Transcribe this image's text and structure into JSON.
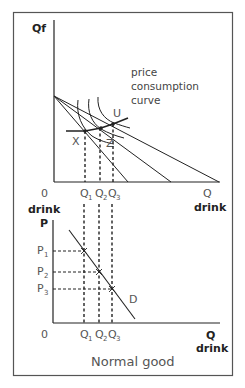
{
  "figure": {
    "caption": "Normal good",
    "top_graph": {
      "y_axis_label": "Qf",
      "x_axis_label": "Q",
      "x_axis_sublabel": "drink",
      "origin_label": "0",
      "origin_sublabel": "drink",
      "curve_annotation_lines": [
        "price",
        "consumption",
        "curve"
      ],
      "points": [
        "X",
        "Z",
        "U"
      ],
      "q_ticks": [
        {
          "main": "Q",
          "sub": "1"
        },
        {
          "main": "Q",
          "sub": "2"
        },
        {
          "main": "Q",
          "sub": "3"
        }
      ]
    },
    "bottom_graph": {
      "y_axis_label": "P",
      "x_axis_label": "Q",
      "x_axis_sublabel": "drink",
      "origin_label": "0",
      "demand_label": "D",
      "p_ticks": [
        {
          "main": "P",
          "sub": "1"
        },
        {
          "main": "P",
          "sub": "2"
        },
        {
          "main": "P",
          "sub": "3"
        }
      ],
      "q_ticks": [
        {
          "main": "Q",
          "sub": "1"
        },
        {
          "main": "Q",
          "sub": "2"
        },
        {
          "main": "Q",
          "sub": "3"
        }
      ]
    }
  }
}
